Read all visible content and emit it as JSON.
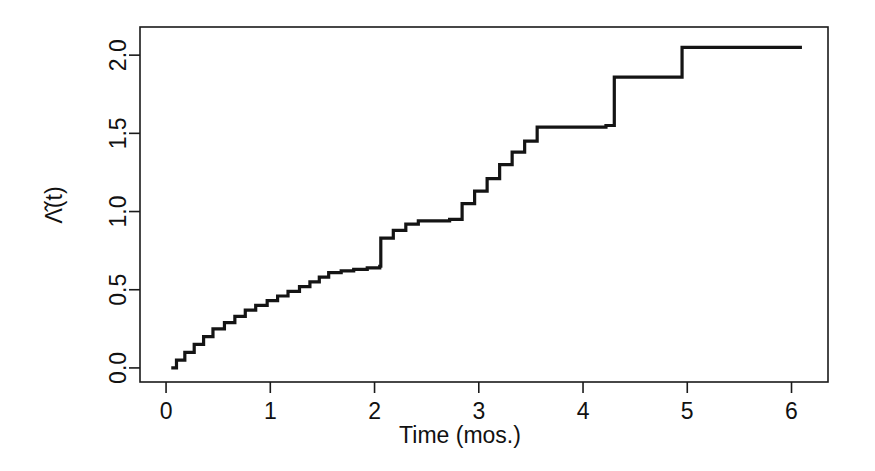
{
  "figure": {
    "background_color": "#ffffff",
    "line_color": "#141414",
    "axis_color": "#1a1a1a",
    "text_color": "#111111"
  },
  "chart_data": {
    "type": "line",
    "subtype": "step-function-cumulative-hazard",
    "title": "",
    "subtitle": "",
    "xlabel": "Time (mos.)",
    "ylabel": "Λ̂(t)",
    "ylabel_plain": "Lambda-hat(t)",
    "xlim": [
      -0.25,
      6.35
    ],
    "ylim": [
      -0.09,
      2.18
    ],
    "xticks": [
      0,
      1,
      2,
      3,
      4,
      5,
      6
    ],
    "xticklabels": [
      "0",
      "1",
      "2",
      "3",
      "4",
      "5",
      "6"
    ],
    "yticks": [
      0.0,
      0.5,
      1.0,
      1.5,
      2.0
    ],
    "yticklabels": [
      "0.0",
      "0.5",
      "1.0",
      "1.5",
      "2.0"
    ],
    "grid": false,
    "legend": null,
    "legend_position": "none",
    "box": true,
    "annotations": [],
    "x": [
      0.05,
      0.1,
      0.18,
      0.27,
      0.36,
      0.45,
      0.56,
      0.66,
      0.76,
      0.86,
      0.97,
      1.07,
      1.17,
      1.28,
      1.38,
      1.47,
      1.56,
      1.68,
      1.8,
      1.93,
      2.05,
      2.06,
      2.18,
      2.3,
      2.42,
      2.72,
      2.84,
      2.96,
      3.08,
      3.2,
      3.32,
      3.44,
      3.56,
      4.22,
      4.3,
      4.95,
      6.1
    ],
    "y": [
      0.0,
      0.05,
      0.1,
      0.15,
      0.2,
      0.25,
      0.29,
      0.33,
      0.37,
      0.4,
      0.43,
      0.46,
      0.49,
      0.52,
      0.55,
      0.58,
      0.61,
      0.62,
      0.63,
      0.64,
      0.65,
      0.83,
      0.88,
      0.92,
      0.94,
      0.95,
      1.05,
      1.13,
      1.21,
      1.3,
      1.38,
      1.45,
      1.54,
      1.55,
      1.86,
      2.05,
      2.05
    ],
    "step_type": "post",
    "series": [
      {
        "name": "Nelson-Aalen cumulative hazard estimate",
        "x": [
          0.05,
          0.1,
          0.18,
          0.27,
          0.36,
          0.45,
          0.56,
          0.66,
          0.76,
          0.86,
          0.97,
          1.07,
          1.17,
          1.28,
          1.38,
          1.47,
          1.56,
          1.68,
          1.8,
          1.93,
          2.05,
          2.06,
          2.18,
          2.3,
          2.42,
          2.72,
          2.84,
          2.96,
          3.08,
          3.2,
          3.32,
          3.44,
          3.56,
          4.22,
          4.3,
          4.95,
          6.1
        ],
        "y": [
          0.0,
          0.05,
          0.1,
          0.15,
          0.2,
          0.25,
          0.29,
          0.33,
          0.37,
          0.4,
          0.43,
          0.46,
          0.49,
          0.52,
          0.55,
          0.58,
          0.61,
          0.62,
          0.63,
          0.64,
          0.65,
          0.83,
          0.88,
          0.92,
          0.94,
          0.95,
          1.05,
          1.13,
          1.21,
          1.3,
          1.38,
          1.45,
          1.54,
          1.55,
          1.86,
          2.05,
          2.05
        ]
      }
    ]
  }
}
